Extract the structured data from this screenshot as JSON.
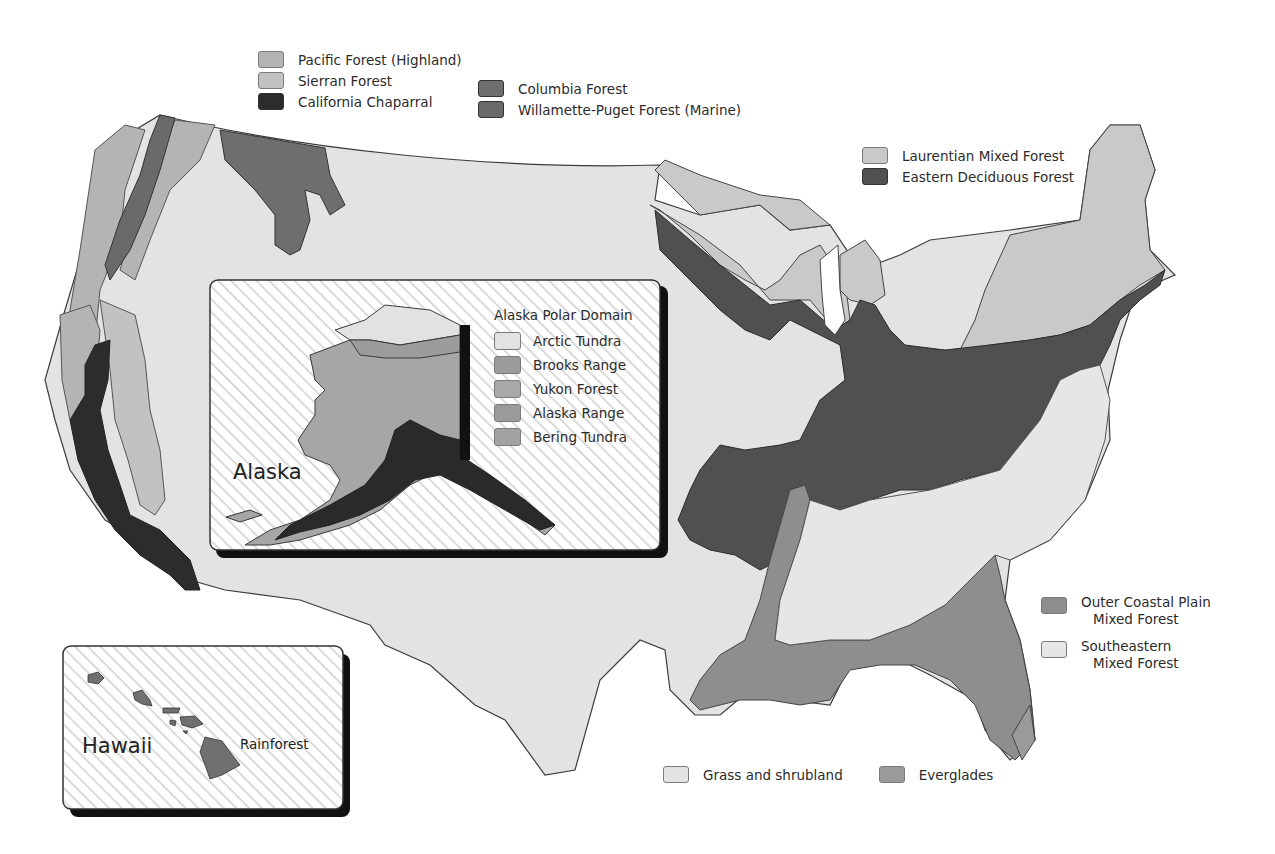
{
  "colors": {
    "pacific_forest_highland": "#b4b4b4",
    "sierran_forest": "#c2c2c2",
    "california_chaparral": "#2c2c2c",
    "columbia_forest": "#6e6e6e",
    "willamette_puget_forest": "#6a6a6a",
    "laurentian_mixed_forest": "#c9c9c9",
    "eastern_deciduous_forest": "#505050",
    "outer_coastal_plain": "#8e8e8e",
    "southeastern_mixed_forest": "#e6e6e6",
    "grass_shrubland": "#e3e3e3",
    "everglades": "#9a9a9a",
    "arctic_tundra": "#e2e2e2",
    "brooks_range": "#9c9c9c",
    "yukon_forest": "#a8a8a8",
    "alaska_range": "#9a9a9a",
    "bering_tundra": "#a2a2a2",
    "rainforest": "#707070",
    "border": "#3c3c3c"
  },
  "legend_west": {
    "items": [
      {
        "label": "Pacific Forest (Highland)",
        "color": "#b4b4b4"
      },
      {
        "label": "Sierran Forest",
        "color": "#c2c2c2"
      },
      {
        "label": "California Chaparral",
        "color": "#2c2c2c"
      },
      {
        "label": "Columbia Forest",
        "color": "#6e6e6e"
      },
      {
        "label": "Willamette-Puget Forest (Marine)",
        "color": "#6a6a6a"
      }
    ]
  },
  "legend_northeast": {
    "items": [
      {
        "label": "Laurentian Mixed Forest",
        "color": "#c9c9c9"
      },
      {
        "label": "Eastern Deciduous Forest",
        "color": "#505050"
      }
    ]
  },
  "legend_southeast": {
    "items": [
      {
        "label_line1": "Outer Coastal Plain",
        "label_line2": "Mixed Forest",
        "color": "#8e8e8e"
      },
      {
        "label_line1": "Southeastern",
        "label_line2": "Mixed Forest",
        "color": "#e6e6e6"
      }
    ]
  },
  "legend_bottom": {
    "items": [
      {
        "label": "Grass and shrubland",
        "color": "#e3e3e3"
      },
      {
        "label": "Everglades",
        "color": "#9a9a9a"
      }
    ]
  },
  "alaska_inset": {
    "title": "Alaska",
    "legend_title": "Alaska Polar Domain",
    "items": [
      {
        "label": "Arctic Tundra",
        "color": "#e2e2e2"
      },
      {
        "label": "Brooks Range",
        "color": "#9c9c9c"
      },
      {
        "label": "Yukon Forest",
        "color": "#a8a8a8"
      },
      {
        "label": "Alaska Range",
        "color": "#9a9a9a"
      },
      {
        "label": "Bering Tundra",
        "color": "#a2a2a2"
      }
    ]
  },
  "hawaii_inset": {
    "title": "Hawaii",
    "region_label": "Rainforest"
  }
}
